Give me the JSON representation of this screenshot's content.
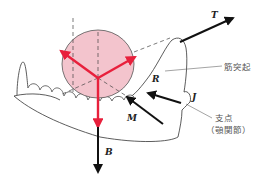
{
  "diagram": {
    "labels": {
      "T": "T",
      "R": "R",
      "M": "M",
      "B": "B",
      "J": "J",
      "coronoid": "筋突起",
      "fulcrum_line1": "支点",
      "fulcrum_line2": "（顎関節）"
    },
    "colors": {
      "force_red": "#e8203c",
      "circle_fill": "#f3c4cd",
      "circle_stroke": "#555555",
      "outline": "#333333",
      "black_arrow": "#111111",
      "leader_line": "#666666"
    },
    "forces": [
      {
        "name": "T",
        "color": "black",
        "direction": "up-right"
      },
      {
        "name": "M",
        "color": "black",
        "direction": "up-left"
      },
      {
        "name": "J",
        "color": "black",
        "direction": "up-left"
      },
      {
        "name": "B",
        "color": "black",
        "direction": "down"
      },
      {
        "name": "red-left",
        "color": "red",
        "direction": "up-left"
      },
      {
        "name": "red-right",
        "color": "red",
        "direction": "up-right"
      },
      {
        "name": "red-down",
        "color": "red",
        "direction": "down"
      }
    ]
  }
}
